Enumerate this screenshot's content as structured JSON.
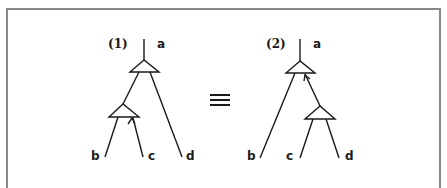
{
  "diagram": {
    "left_tree": {
      "label": "(1)",
      "root": "a",
      "leaves": [
        "b",
        "c",
        "d"
      ]
    },
    "equivalence_symbol": "≡",
    "right_tree": {
      "label": "(2)",
      "root": "a",
      "leaves": [
        "b",
        "c",
        "d"
      ]
    }
  }
}
